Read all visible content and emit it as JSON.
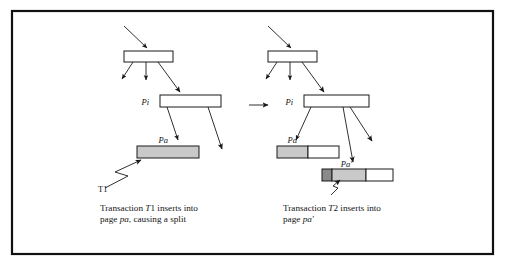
{
  "figure": {
    "kind": "btree-page-split-diagram",
    "frame": {
      "border_color": "#111111"
    },
    "background": "#ffffff",
    "transition_arrow": "→",
    "left_panel": {
      "name": "before-split",
      "nodes": {
        "root_label": "",
        "internal_label": "Pi",
        "leaf_label": "Pa",
        "transaction_label": "T1"
      },
      "caption_line1_prefix": "Transaction ",
      "caption_line1_italic": "T",
      "caption_line1_mid": "1 inserts into",
      "caption_line2_prefix": "page ",
      "caption_line2_italic": "pa",
      "caption_line2_suffix": ", causing a split",
      "caption_full": "Transaction T1 inserts into page pa, causing a split"
    },
    "right_panel": {
      "name": "after-split",
      "nodes": {
        "root_label": "",
        "internal_label": "Pi",
        "leaf_label": "Pa",
        "new_leaf_label": "Pa'",
        "transaction_label": "T2"
      },
      "caption_line1_prefix": "Transaction ",
      "caption_line1_italic": "T",
      "caption_line1_mid": "2 inserts into",
      "caption_line2_prefix": "page ",
      "caption_line2_italic": "pa'",
      "caption_line2_suffix": "",
      "caption_full": "Transaction T2 inserts into page pa'"
    },
    "colors": {
      "page_filled": "#c9c9c9",
      "page_empty": "#ffffff",
      "page_inserted": "#8a8a8a",
      "stroke": "#1a1a1a"
    }
  }
}
